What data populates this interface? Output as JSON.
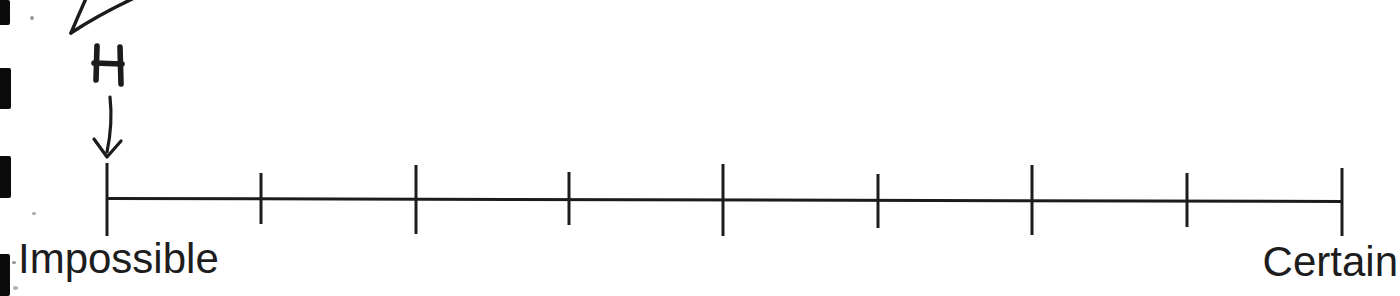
{
  "page": {
    "type": "scanned-worksheet-fragment",
    "background_color": "#ffffff",
    "ink_color": "#1c1c1c",
    "label_color": "#1d1d1d"
  },
  "annotation": {
    "event_label": "H",
    "arrow_icon": "down-arrow",
    "points_to": "first tick (Impossible end of scale)"
  },
  "scale": {
    "left_label": "Impossible",
    "right_label": "Certain",
    "tick_count": 9,
    "interval_count": 8,
    "line": {
      "x1": 106,
      "y1": 198.5,
      "x2": 1343,
      "y2": 201.5,
      "stroke_width": 3
    },
    "ticks": [
      {
        "x": 107,
        "top": 163,
        "bottom": 236
      },
      {
        "x": 261,
        "top": 173,
        "bottom": 224
      },
      {
        "x": 416,
        "top": 165,
        "bottom": 234
      },
      {
        "x": 569,
        "top": 172,
        "bottom": 225
      },
      {
        "x": 723,
        "top": 164,
        "bottom": 236
      },
      {
        "x": 878,
        "top": 174,
        "bottom": 228
      },
      {
        "x": 1032,
        "top": 165,
        "bottom": 235
      },
      {
        "x": 1187,
        "top": 173,
        "bottom": 227
      },
      {
        "x": 1342,
        "top": 168,
        "bottom": 236
      }
    ]
  },
  "artifacts": {
    "binding_marks": [
      {
        "y": 0,
        "height": 25,
        "width": 10
      },
      {
        "y": 68,
        "height": 41,
        "width": 11
      },
      {
        "y": 156,
        "height": 42,
        "width": 11
      },
      {
        "y": 254,
        "height": 42,
        "width": 10
      }
    ],
    "specks": [
      {
        "x": 30,
        "y": 16,
        "w": 4,
        "h": 4,
        "color": "#9a9a9a"
      },
      {
        "x": 32,
        "y": 212,
        "w": 4,
        "h": 3,
        "color": "#a6a6a6"
      },
      {
        "x": 12,
        "y": 261,
        "w": 4,
        "h": 3,
        "color": "#8f8f8f"
      },
      {
        "x": 13,
        "y": 286,
        "w": 5,
        "h": 4,
        "color": "#b0b0b0"
      }
    ]
  }
}
